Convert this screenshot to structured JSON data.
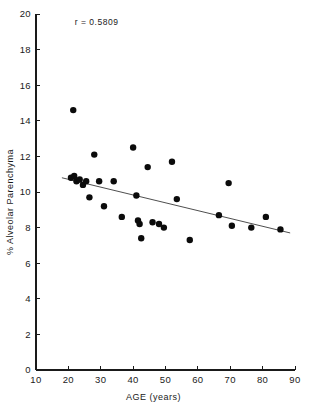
{
  "chart_data": {
    "type": "scatter",
    "title": "",
    "xlabel": "AGE   (years)",
    "ylabel": "% Alveolar Parenchyma",
    "xlim": [
      10,
      90
    ],
    "ylim": [
      0,
      20
    ],
    "xticks": [
      10,
      20,
      30,
      40,
      50,
      60,
      70,
      80,
      90
    ],
    "xtick_labels": [
      "10",
      "20",
      "30",
      "40",
      "50",
      "60",
      "70",
      "80",
      "90"
    ],
    "yticks": [
      0,
      2,
      4,
      6,
      8,
      10,
      12,
      14,
      16,
      18,
      20
    ],
    "ytick_labels": [
      "0",
      "2",
      "4",
      "6",
      "8",
      "10",
      "12",
      "14",
      "16",
      "18",
      "20"
    ],
    "grid": false,
    "legend": "none",
    "annotation": "r = 0.5809",
    "annotation_x": 22,
    "annotation_y": 19.4,
    "marker_color": "#0b0b0b",
    "marker_size": 3.2,
    "axis_color": "#1a1a1a",
    "fit_line": {
      "label": "regression line",
      "color": "#3a3a3a",
      "x_start": 18.0,
      "y_start": 10.8,
      "x_end": 88.5,
      "y_end": 7.7
    },
    "points": [
      {
        "x": 21.5,
        "y": 14.6
      },
      {
        "x": 20.8,
        "y": 10.8
      },
      {
        "x": 21.8,
        "y": 10.9
      },
      {
        "x": 22.5,
        "y": 10.6
      },
      {
        "x": 23.5,
        "y": 10.7
      },
      {
        "x": 24.5,
        "y": 10.4
      },
      {
        "x": 25.5,
        "y": 10.6
      },
      {
        "x": 26.5,
        "y": 9.7
      },
      {
        "x": 28.0,
        "y": 12.1
      },
      {
        "x": 29.5,
        "y": 10.6
      },
      {
        "x": 31.0,
        "y": 9.2
      },
      {
        "x": 34.0,
        "y": 10.6
      },
      {
        "x": 36.5,
        "y": 8.6
      },
      {
        "x": 40.0,
        "y": 12.5
      },
      {
        "x": 41.0,
        "y": 9.8
      },
      {
        "x": 41.5,
        "y": 8.4
      },
      {
        "x": 42.0,
        "y": 8.2
      },
      {
        "x": 42.5,
        "y": 7.4
      },
      {
        "x": 44.5,
        "y": 11.4
      },
      {
        "x": 46.0,
        "y": 8.3
      },
      {
        "x": 48.0,
        "y": 8.2
      },
      {
        "x": 49.5,
        "y": 8.0
      },
      {
        "x": 52.0,
        "y": 11.7
      },
      {
        "x": 53.5,
        "y": 9.6
      },
      {
        "x": 57.5,
        "y": 7.3
      },
      {
        "x": 66.5,
        "y": 8.7
      },
      {
        "x": 69.5,
        "y": 10.5
      },
      {
        "x": 70.5,
        "y": 8.1
      },
      {
        "x": 76.5,
        "y": 8.0
      },
      {
        "x": 81.0,
        "y": 8.6
      },
      {
        "x": 85.5,
        "y": 7.9
      }
    ]
  }
}
